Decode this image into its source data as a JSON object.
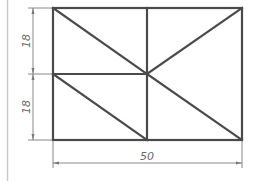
{
  "drawing": {
    "type": "technical-drawing",
    "dimensions": {
      "upper_height": "18",
      "lower_height": "18",
      "width": "50"
    },
    "colors": {
      "outline": "#4a4a4a",
      "dimension": "#7a7a7a",
      "border": "#c8c8c8"
    }
  }
}
